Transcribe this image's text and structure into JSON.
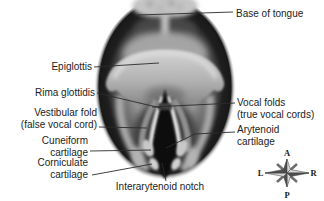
{
  "annotations": {
    "base_of_tongue": {
      "text": "Base of tongue"
    },
    "epiglottis": {
      "text": "Epiglottis"
    },
    "rima_glottidis": {
      "text": "Rima glottidis"
    },
    "vestibular_fold": {
      "line1": "Vestibular fold",
      "line2": "(false vocal cord)"
    },
    "cuneiform_cartilage": {
      "line1": "Cuneiform",
      "line2": "cartilage"
    },
    "corniculate_cartilage": {
      "line1": "Corniculate",
      "line2": "cartilage"
    },
    "vocal_folds": {
      "line1": "Vocal folds",
      "line2": "(true vocal cords)"
    },
    "arytenoid_cartilage": {
      "line1": "Arytenoid",
      "line2": "cartilage"
    },
    "interarytenoid_notch": {
      "text": "Interarytenoid notch"
    }
  },
  "compass": {
    "anterior": "A",
    "posterior": "P",
    "left": "L",
    "right": "R"
  },
  "colors": {
    "background": "#ffffff",
    "label_text": "#1c1c1c",
    "leader_line": "#2b2b2b",
    "illustration_dark": "#0a0a0a",
    "illustration_light": "#d2d2d2"
  }
}
